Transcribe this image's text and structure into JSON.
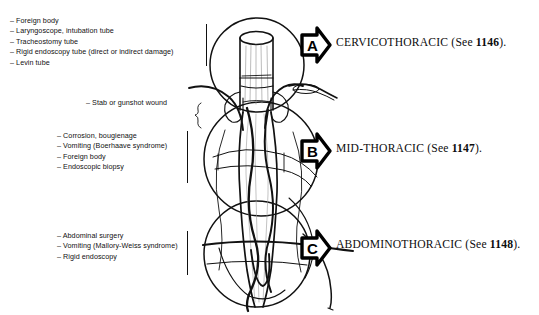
{
  "figure": {
    "type": "medical-anatomy-diagram",
    "ink_color": "#111111",
    "background_color": "#ffffff"
  },
  "etiologies": {
    "cervicothoracic": {
      "items": [
        "– Foreign body",
        "– Laryngoscope, intubation tube",
        "– Tracheostomy tube",
        "– Rigid endoscopy tube (direct or indirect damage)",
        "– Levin tube"
      ]
    },
    "stab": {
      "items": [
        "– Stab or gunshot wound"
      ]
    },
    "midthoracic": {
      "items": [
        "– Corrosion, bougienage",
        "– Vomiting (Boerhaave syndrome)",
        "– Foreign body",
        "– Endoscopic biopsy"
      ]
    },
    "abdominothoracic": {
      "items": [
        "– Abdominal surgery",
        "– Vomiting (Mallory-Weiss syndrome)",
        "– Rigid endoscopy"
      ]
    }
  },
  "regions": [
    {
      "marker": "A",
      "name": "CERVICOTHORACIC",
      "reference_prefix": "(See ",
      "reference_number": "1146",
      "reference_suffix": ")."
    },
    {
      "marker": "B",
      "name": "MID-THORACIC",
      "reference_prefix": "(See ",
      "reference_number": "1147",
      "reference_suffix": ")."
    },
    {
      "marker": "C",
      "name": "ABDOMINOTHORACIC",
      "reference_prefix": "(See ",
      "reference_number": "1148",
      "reference_suffix": ")."
    }
  ]
}
